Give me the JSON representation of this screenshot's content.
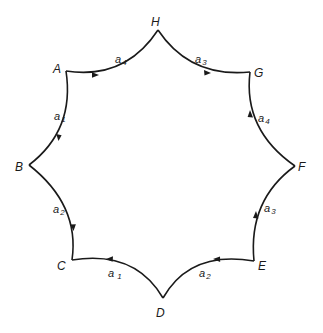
{
  "diagram": {
    "type": "hyperbolic-octagon-fundamental-polygon",
    "colors": {
      "stroke": "#1a1a1a",
      "background": "#ffffff"
    },
    "vertices": [
      {
        "id": "H",
        "label": "H",
        "x": 158,
        "y": 30,
        "lx": 151,
        "ly": 24
      },
      {
        "id": "G",
        "label": "G",
        "x": 250,
        "y": 72,
        "lx": 254,
        "ly": 76
      },
      {
        "id": "F",
        "label": "F",
        "x": 295,
        "y": 166,
        "lx": 299,
        "ly": 171
      },
      {
        "id": "E",
        "label": "E",
        "x": 254,
        "y": 261,
        "lx": 258,
        "ly": 270
      },
      {
        "id": "D",
        "label": "D",
        "x": 163,
        "y": 298,
        "lx": 156,
        "ly": 317
      },
      {
        "id": "C",
        "label": "C",
        "x": 72,
        "y": 260,
        "lx": 58,
        "ly": 270
      },
      {
        "id": "B",
        "label": "B",
        "x": 29,
        "y": 165,
        "lx": 15,
        "ly": 171
      },
      {
        "id": "A",
        "label": "A",
        "x": 66,
        "y": 71,
        "lx": 52,
        "ly": 73
      }
    ],
    "edges": [
      {
        "id": "AH",
        "from": "A",
        "to": "H",
        "label": "a",
        "sub": "4",
        "direction": "A→H"
      },
      {
        "id": "HG",
        "from": "H",
        "to": "G",
        "label": "a",
        "sub": "3",
        "direction": "H→G"
      },
      {
        "id": "FG",
        "from": "F",
        "to": "G",
        "label": "a",
        "sub": "4",
        "direction": "F→G"
      },
      {
        "id": "EF",
        "from": "E",
        "to": "F",
        "label": "a",
        "sub": "3",
        "direction": "E→F"
      },
      {
        "id": "ED",
        "from": "E",
        "to": "D",
        "label": "a",
        "sub": "2",
        "direction": "E→D"
      },
      {
        "id": "DC",
        "from": "D",
        "to": "C",
        "label": "a",
        "sub": "1",
        "direction": "D→C"
      },
      {
        "id": "BC",
        "from": "B",
        "to": "C",
        "label": "a",
        "sub": "2",
        "direction": "B→C"
      },
      {
        "id": "AB",
        "from": "A",
        "to": "B",
        "label": "a",
        "sub": "1",
        "direction": "A→B"
      }
    ]
  },
  "labels": {
    "H": "H",
    "G": "G",
    "F": "F",
    "E": "E",
    "D": "D",
    "C": "C",
    "B": "B",
    "A": "A",
    "a": "a",
    "e_AH_sub": "4",
    "e_HG_sub": "3",
    "e_FG_sub": "4",
    "e_EF_sub": "3",
    "e_ED_sub": "2",
    "e_DC_sub": "1",
    "e_BC_sub": "2",
    "e_AB_sub": "1"
  }
}
